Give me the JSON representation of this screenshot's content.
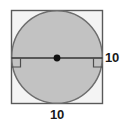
{
  "figure": {
    "canvas": {
      "width": 120,
      "height": 126
    },
    "colors": {
      "background": "#ffffff",
      "square_fill": "#f4f4f4",
      "square_stroke": "#595959",
      "circle_fill": "#c2c2c2",
      "circle_stroke": "#6e6e6e",
      "diameter_stroke": "#333333",
      "center_dot": "#111111",
      "right_angle_stroke": "#4d4d4d",
      "label_text": "#1a1a1a"
    },
    "square": {
      "x": 11,
      "y": 10,
      "width": 92,
      "height": 94,
      "side_length": 10
    },
    "circle": {
      "center_x": 57,
      "center_y": 57,
      "radius_x": 46,
      "radius_y": 47,
      "diameter": 10
    },
    "diameter_line": {
      "x1": 11,
      "y1": 58,
      "x2": 103,
      "y2": 58,
      "length": 10
    },
    "center_point": {
      "x": 57,
      "y": 58,
      "radius": 3.4
    },
    "right_angle_markers": [
      {
        "position": "left",
        "x": 11,
        "y": 58,
        "size": 9
      },
      {
        "position": "right",
        "x": 103,
        "y": 58,
        "size": 9
      }
    ],
    "labels": {
      "right": "10",
      "bottom": "10"
    }
  }
}
